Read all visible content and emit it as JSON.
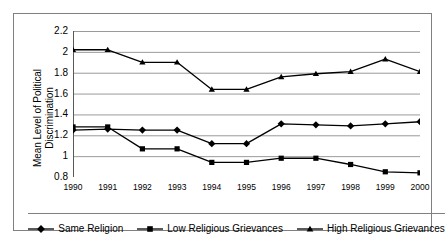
{
  "chart_data": {
    "type": "line",
    "title": "",
    "xlabel": "",
    "ylabel": "Mean Level of Political Discrimination",
    "ylabel_lines": [
      "Mean Level of Political",
      "Discrimination"
    ],
    "categories": [
      "1990",
      "1991",
      "1992",
      "1993",
      "1994",
      "1995",
      "1996",
      "1997",
      "1998",
      "1999",
      "2000"
    ],
    "xlim": [
      1990,
      2000
    ],
    "ylim": [
      0.8,
      2.2
    ],
    "yticks": [
      0.8,
      1,
      1.2,
      1.4,
      1.6,
      1.8,
      2,
      2.2
    ],
    "ytick_labels": [
      "0.8",
      "1",
      "1.2",
      "1.4",
      "1.6",
      "1.8",
      "2",
      "2.2"
    ],
    "grid": "horizontal",
    "legend_position": "bottom",
    "series": [
      {
        "name": "Same Religion",
        "marker": "diamond",
        "color": "#000000",
        "values": [
          1.25,
          1.26,
          1.25,
          1.25,
          1.12,
          1.12,
          1.31,
          1.3,
          1.29,
          1.31,
          1.33
        ]
      },
      {
        "name": "Low Religious Grievances",
        "marker": "square",
        "color": "#000000",
        "values": [
          1.28,
          1.28,
          1.07,
          1.07,
          0.94,
          0.94,
          0.98,
          0.98,
          0.92,
          0.85,
          0.84
        ]
      },
      {
        "name": "High Religious Grievances",
        "marker": "triangle",
        "color": "#000000",
        "values": [
          2.02,
          2.02,
          1.9,
          1.9,
          1.64,
          1.64,
          1.76,
          1.79,
          1.81,
          1.93,
          1.81
        ]
      }
    ]
  },
  "legend": {
    "items": [
      {
        "label": "Same Religion",
        "marker": "diamond"
      },
      {
        "label": "Low Religious Grievances",
        "marker": "square"
      },
      {
        "label": "High Religious Grievances",
        "marker": "triangle"
      }
    ]
  }
}
